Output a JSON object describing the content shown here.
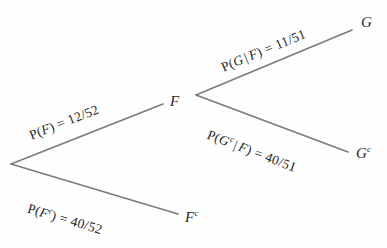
{
  "diagram": {
    "type": "probability-tree",
    "line_color": "#7b7b7b",
    "text_color": "#262626",
    "background_color": "#fefefe",
    "root": {
      "name": "root-node",
      "label": "",
      "x": 11,
      "y": 164
    },
    "nodes": [
      {
        "id": "F",
        "label": "F",
        "superscript": "",
        "x": 170,
        "y": 101,
        "level": 1
      },
      {
        "id": "Fc",
        "label": "F",
        "superscript": "c",
        "x": 185,
        "y": 215,
        "level": 1
      },
      {
        "id": "G",
        "label": "G",
        "superscript": "",
        "x": 361,
        "y": 22,
        "level": 2
      },
      {
        "id": "Gc",
        "label": "G",
        "superscript": "c",
        "x": 356,
        "y": 152,
        "level": 2
      }
    ],
    "edges": [
      {
        "id": "root-to-F",
        "from": "root",
        "to": "F",
        "label_prefix": "P(",
        "label_event": "F",
        "label_event_sup": "",
        "label_condition": "",
        "label_suffix": ") = ",
        "probability": "12/52",
        "numerator": 12,
        "denominator": 52,
        "full_label": "P(F) = 12/52",
        "x1": 11,
        "y1": 164,
        "x2": 163,
        "y2": 104,
        "angle_deg": -21.5
      },
      {
        "id": "root-to-Fc",
        "from": "root",
        "to": "Fc",
        "label_prefix": "P(",
        "label_event": "F",
        "label_event_sup": "c",
        "label_condition": "",
        "label_suffix": ") = ",
        "probability": "40/52",
        "numerator": 40,
        "denominator": 52,
        "full_label": "P(Fc) = 40/52",
        "x1": 11,
        "y1": 164,
        "x2": 178,
        "y2": 214,
        "angle_deg": 16.5
      },
      {
        "id": "F-to-G",
        "from": "F",
        "to": "G",
        "label_prefix": "P(",
        "label_event": "G",
        "label_event_sup": "",
        "label_condition": "F",
        "label_suffix": ") = ",
        "probability": "11/51",
        "numerator": 11,
        "denominator": 51,
        "full_label": "P(G | F) = 11/51",
        "x1": 196,
        "y1": 95,
        "x2": 352,
        "y2": 30,
        "angle_deg": -22.5
      },
      {
        "id": "F-to-Gc",
        "from": "F",
        "to": "Gc",
        "label_prefix": "P(",
        "label_event": "G",
        "label_event_sup": "c",
        "label_condition": "F",
        "label_suffix": ") = ",
        "probability": "40/51",
        "numerator": 40,
        "denominator": 51,
        "full_label": "P(Gc | F) = 40/51",
        "x1": 196,
        "y1": 95,
        "x2": 348,
        "y2": 152,
        "angle_deg": 21
      }
    ],
    "symbols": {
      "conditional_bar": "|",
      "complement_mark": "c",
      "equals": "="
    }
  }
}
